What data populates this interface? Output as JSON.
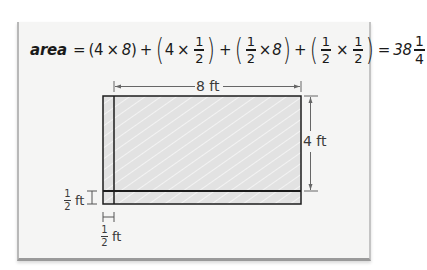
{
  "equation": {
    "lhs": "area",
    "equals": "=",
    "terms": [
      {
        "a": "4",
        "op": "×",
        "b": "8"
      },
      {
        "a": "4",
        "op": "×",
        "b": {
          "num": "1",
          "den": "2"
        }
      },
      {
        "a": {
          "num": "1",
          "den": "2"
        },
        "op": "×",
        "b": "8"
      },
      {
        "a": {
          "num": "1",
          "den": "2"
        },
        "op": "×",
        "b": {
          "num": "1",
          "den": "2"
        }
      }
    ],
    "plus": "+",
    "result": {
      "whole": "38",
      "num": "1",
      "den": "4"
    },
    "t1a": "4",
    "t1op": "×",
    "t1b": "8",
    "t2a": "4",
    "t2op": "×",
    "t2bnum": "1",
    "t2bden": "2",
    "t3anum": "1",
    "t3aden": "2",
    "t3op": "×",
    "t3b": "8",
    "t4anum": "1",
    "t4aden": "2",
    "t4op": "×",
    "t4bnum": "1",
    "t4bden": "2",
    "result_whole": "38",
    "result_num": "1",
    "result_den": "4"
  },
  "diagram": {
    "width_label": "8 ft",
    "height_label": "4 ft",
    "strip_left_label": {
      "num": "1",
      "den": "2",
      "unit": "ft"
    },
    "strip_bottom_label": {
      "num": "1",
      "den": "2",
      "unit": "ft"
    },
    "dimensions": {
      "length_ft": 8,
      "width_ft": 4,
      "extension_ft": 0.5,
      "total_area": 38.25
    },
    "colors": {
      "fill": "#e2e2e2",
      "stroke": "#1c1c1c",
      "dimension_line": "#555555",
      "card": "#f5f5f4"
    }
  },
  "open_paren": "(",
  "close_paren": ")"
}
